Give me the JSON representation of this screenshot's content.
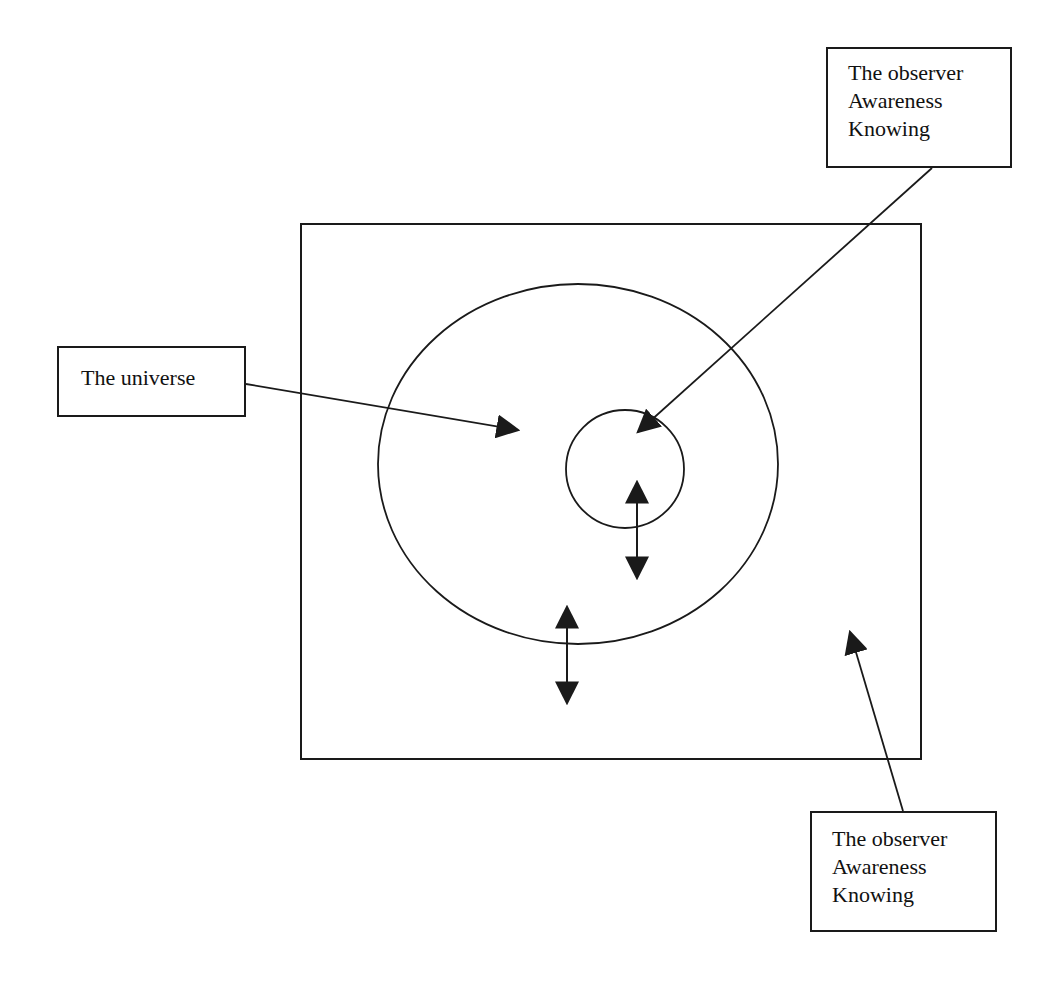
{
  "diagram": {
    "title": "",
    "line_color": "#1a1a1a",
    "background_color": "#ffffff",
    "labels": {
      "observer_top": {
        "lines": [
          "The observer",
          "Awareness",
          "Knowing"
        ],
        "points_to": "inner-circle"
      },
      "universe": {
        "lines": [
          "The universe"
        ],
        "points_to": "large-ellipse"
      },
      "observer_bottom": {
        "lines": [
          "The observer",
          "Awareness",
          "Knowing"
        ],
        "points_to": "outer-rectangle"
      }
    },
    "shapes": [
      {
        "id": "outer-rectangle",
        "kind": "rectangle",
        "represents": "The observer / Awareness / Knowing"
      },
      {
        "id": "large-ellipse",
        "kind": "ellipse",
        "represents": "The universe"
      },
      {
        "id": "inner-circle",
        "kind": "circle",
        "represents": "The observer / Awareness / Knowing"
      }
    ],
    "connectors": [
      {
        "id": "double-arrow-inner",
        "kind": "bidirectional",
        "between": [
          "inner-circle",
          "large-ellipse"
        ]
      },
      {
        "id": "double-arrow-outer",
        "kind": "bidirectional",
        "between": [
          "large-ellipse",
          "outer-rectangle"
        ]
      }
    ]
  }
}
